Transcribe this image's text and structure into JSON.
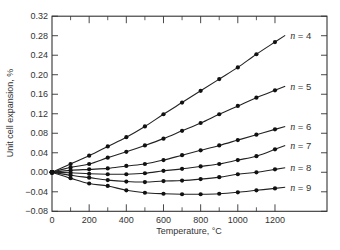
{
  "chart_data": {
    "type": "line",
    "title": "",
    "xlabel": "Temperature, °C",
    "ylabel": "Unit cell expansion, %",
    "xlim": [
      0,
      1480
    ],
    "ylim": [
      -0.08,
      0.32
    ],
    "x_ticks": [
      0,
      200,
      400,
      600,
      800,
      1000,
      1200
    ],
    "x_tick_labels": [
      "0",
      "200",
      "400",
      "600",
      "800",
      "1000",
      "1200"
    ],
    "x_minor_ticks": [
      100,
      300,
      500,
      700,
      900,
      1100
    ],
    "y_ticks": [
      -0.08,
      -0.04,
      0.0,
      0.04,
      0.08,
      0.12,
      0.16,
      0.2,
      0.24,
      0.28,
      0.32
    ],
    "y_tick_labels": [
      "-0.08",
      "-0.04",
      "0.00",
      "0.04",
      "0.08",
      "0.12",
      "0.16",
      "0.20",
      "0.24",
      "0.28",
      "0.32"
    ],
    "grid": false,
    "legend": "inline labels at right end of each curve",
    "x": [
      0,
      100,
      200,
      300,
      400,
      500,
      600,
      700,
      800,
      900,
      1000,
      1100,
      1200
    ],
    "series": [
      {
        "name": "n = 4",
        "label_var": "n",
        "label_val": "4",
        "values": [
          0,
          0.017,
          0.034,
          0.053,
          0.072,
          0.094,
          0.119,
          0.143,
          0.167,
          0.191,
          0.215,
          0.242,
          0.267
        ]
      },
      {
        "name": "n = 5",
        "label_var": "n",
        "label_val": "5",
        "values": [
          0,
          0.01,
          0.017,
          0.03,
          0.042,
          0.055,
          0.069,
          0.085,
          0.101,
          0.119,
          0.136,
          0.153,
          0.168
        ]
      },
      {
        "name": "n = 6",
        "label_var": "n",
        "label_val": "6",
        "values": [
          0,
          0.004,
          0.006,
          0.008,
          0.013,
          0.017,
          0.025,
          0.035,
          0.045,
          0.055,
          0.066,
          0.077,
          0.088
        ]
      },
      {
        "name": "n = 7",
        "label_var": "n",
        "label_val": "7",
        "values": [
          0,
          -0.001,
          -0.003,
          -0.004,
          -0.004,
          -0.002,
          0.003,
          0.007,
          0.012,
          0.017,
          0.025,
          0.033,
          0.047
        ]
      },
      {
        "name": "n = 8",
        "label_var": "n",
        "label_val": "8",
        "values": [
          0,
          -0.006,
          -0.011,
          -0.016,
          -0.019,
          -0.02,
          -0.018,
          -0.017,
          -0.014,
          -0.01,
          -0.004,
          0.0,
          0.006
        ]
      },
      {
        "name": "n = 9",
        "label_var": "n",
        "label_val": "9",
        "values": [
          0,
          -0.012,
          -0.023,
          -0.028,
          -0.037,
          -0.042,
          -0.044,
          -0.045,
          -0.045,
          -0.044,
          -0.041,
          -0.037,
          -0.033
        ]
      }
    ],
    "colors": {
      "line": "#222222",
      "marker": "#111111",
      "axis": "#333333",
      "background": "#ffffff"
    }
  }
}
